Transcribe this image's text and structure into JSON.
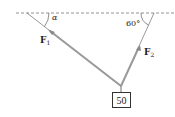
{
  "diagram": {
    "type": "force-diagram",
    "forces": [
      {
        "name": "F",
        "subscript": "1",
        "angle_label": "α"
      },
      {
        "name": "F",
        "subscript": "2",
        "angle_label": "60°"
      }
    ],
    "weight_label": "50",
    "colors": {
      "rope": "#9a9a9a",
      "line": "#333333",
      "dashed": "#777777"
    }
  }
}
